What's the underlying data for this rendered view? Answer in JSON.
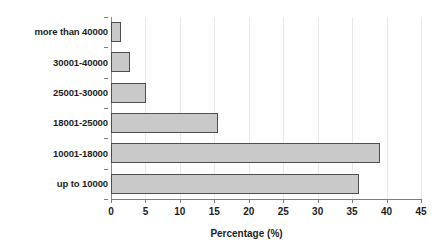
{
  "chart_data": {
    "type": "bar",
    "orientation": "horizontal",
    "title": "",
    "subtitle": "",
    "xlabel": "Percentage (%)",
    "ylabel": "",
    "categories": [
      "up to 10000",
      "10001-18000",
      "18001-25000",
      "25001-30000",
      "30001-40000",
      "more than 40000"
    ],
    "values": [
      36.0,
      39.0,
      15.5,
      5.1,
      2.7,
      1.5
    ],
    "series": [
      {
        "name": "Percentage",
        "values": [
          36.0,
          39.0,
          15.5,
          5.1,
          2.7,
          1.5
        ]
      }
    ],
    "xlim": [
      0,
      45
    ],
    "xticks": [
      0,
      5,
      10,
      15,
      20,
      25,
      30,
      35,
      40,
      45
    ],
    "xtick_labels": [
      "0",
      "5",
      "10",
      "15",
      "20",
      "25",
      "30",
      "35",
      "40",
      "45"
    ],
    "grid": true,
    "grid_axis": "x",
    "legend": false,
    "legend_position": "none",
    "bar_fill_color": "#c9c9c9",
    "bar_border_color": "#4f4f4f",
    "gridline_color": "#e9e9e9",
    "axis_color": "#7d7d7d",
    "text_color": "#1d1d1d",
    "background_color": "#ffffff"
  }
}
